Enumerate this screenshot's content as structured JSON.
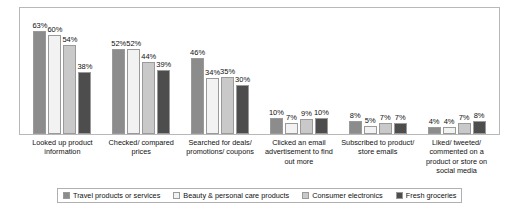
{
  "chart_data": {
    "type": "bar",
    "title": "",
    "subtitle": "",
    "xlabel": "",
    "ylabel": "",
    "ylim": [
      0,
      70
    ],
    "grid": false,
    "legend_position": "bottom",
    "value_suffix": "%",
    "categories": [
      "Looked up product information",
      "Checked/ compared prices",
      "Searched for deals/ promotions/ coupons",
      "Clicked an email advertisement to find out more",
      "Subscribed to product/ store emails",
      "Liked/ tweeted/ commented on a product or store on social media"
    ],
    "series": [
      {
        "name": "Travel products or services",
        "color": "#8c8c8c",
        "values": [
          63,
          52,
          46,
          10,
          8,
          4
        ],
        "labels": [
          "63%",
          "52%",
          "46%",
          "10%",
          "8%",
          "4%"
        ]
      },
      {
        "name": "Beauty & personal care products",
        "color": "#f2f2f2",
        "values": [
          60,
          52,
          34,
          7,
          5,
          4
        ],
        "labels": [
          "60%",
          "52%",
          "34%",
          "7%",
          "5%",
          "4%"
        ]
      },
      {
        "name": "Consumer electronics",
        "color": "#c9c9c9",
        "values": [
          54,
          44,
          35,
          9,
          7,
          7
        ],
        "labels": [
          "54%",
          "44%",
          "35%",
          "9%",
          "7%",
          "7%"
        ]
      },
      {
        "name": "Fresh groceries",
        "color": "#4d4d4d",
        "values": [
          38,
          39,
          30,
          10,
          7,
          8
        ],
        "labels": [
          "38%",
          "39%",
          "30%",
          "10%",
          "7%",
          "8%"
        ]
      }
    ]
  }
}
